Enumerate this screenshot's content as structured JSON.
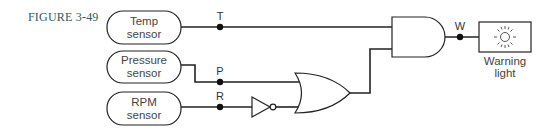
{
  "figure": {
    "label": "FIGURE 3-49"
  },
  "sensors": [
    {
      "line1": "Temp",
      "line2": "sensor"
    },
    {
      "line1": "Pressure",
      "line2": "sensor"
    },
    {
      "line1": "RPM",
      "line2": "sensor"
    }
  ],
  "signals": {
    "t": "T",
    "p": "P",
    "r": "R",
    "w": "W"
  },
  "gates": {
    "inverter": "NOT",
    "or": "OR",
    "and": "AND"
  },
  "output": {
    "line1": "Warning",
    "line2": "light",
    "icon": "sun-icon"
  },
  "colors": {
    "line": "#222222",
    "label": "#2f5a5e"
  }
}
